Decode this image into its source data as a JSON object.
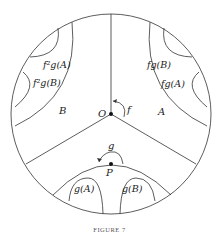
{
  "figure": {
    "caption": "FIGURE 7",
    "disk": {
      "cx": 111,
      "cy": 114,
      "r": 100
    },
    "points": {
      "O": {
        "label": "O",
        "x": 111,
        "y": 114
      },
      "P": {
        "label": "P",
        "x": 111,
        "y": 164
      }
    },
    "transformations": {
      "f": {
        "label": "f"
      },
      "g": {
        "label": "g"
      }
    },
    "regions": {
      "A": {
        "label": "A"
      },
      "B": {
        "label": "B"
      },
      "fgA": {
        "label": "fg(A)"
      },
      "fgB": {
        "label": "fg(B)"
      },
      "f2gA": {
        "label": "f²g(A)"
      },
      "f2gB": {
        "label": "f²g(B)"
      },
      "gA": {
        "label": "g(A)"
      },
      "gB": {
        "label": "g(B)"
      }
    },
    "colors": {
      "stroke": "#333333",
      "text": "#222222",
      "caption": "#555555"
    }
  }
}
